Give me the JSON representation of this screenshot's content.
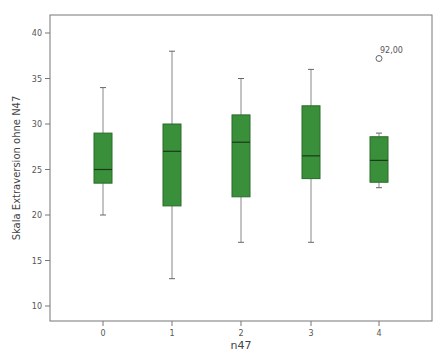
{
  "chart_data": {
    "type": "boxplot",
    "title": "",
    "xlabel": "n47",
    "ylabel": "Skala Extraversion ohne N47",
    "categories": [
      "0",
      "1",
      "2",
      "3",
      "4"
    ],
    "ylim": [
      8.5,
      42
    ],
    "yticks": [
      10,
      15,
      20,
      25,
      30,
      35,
      40
    ],
    "grid": false,
    "legend": null,
    "box_color": "#3a8f3a",
    "box_edge_color": "#2a6a2a",
    "series": [
      {
        "category": "0",
        "whisker_low": 20,
        "q1": 23.5,
        "median": 25,
        "q3": 29,
        "whisker_high": 34,
        "outliers": []
      },
      {
        "category": "1",
        "whisker_low": 13,
        "q1": 21,
        "median": 27,
        "q3": 30,
        "whisker_high": 38,
        "outliers": []
      },
      {
        "category": "2",
        "whisker_low": 17,
        "q1": 22,
        "median": 28,
        "q3": 31,
        "whisker_high": 35,
        "outliers": []
      },
      {
        "category": "3",
        "whisker_low": 17,
        "q1": 24,
        "median": 26.5,
        "q3": 32,
        "whisker_high": 36,
        "outliers": []
      },
      {
        "category": "4",
        "whisker_low": 23,
        "q1": 23.6,
        "median": 26,
        "q3": 28.6,
        "whisker_high": 29,
        "outliers": [
          {
            "value": 37.2,
            "label": "92,00"
          }
        ]
      }
    ]
  }
}
